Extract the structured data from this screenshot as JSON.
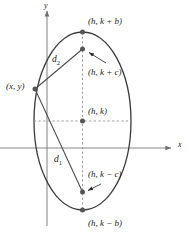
{
  "figure": {
    "type": "ellipse-definition-diagram",
    "background_color": "#ffffff",
    "curve_color": "#3a3a3a",
    "axis_color": "#8a8a8a",
    "dash_color": "#9a9a9a",
    "point_color": "#555555",
    "text_color": "#1a1a1a"
  },
  "axes": {
    "x_label": "x",
    "y_label": "y",
    "x_axis": {
      "y": 148,
      "x_start": 0,
      "x_end": 171,
      "arrow": true
    },
    "y_axis": {
      "x": 47,
      "y_start": 11,
      "y_end": 226,
      "arrow": true
    }
  },
  "ellipse": {
    "center_x": 82.5,
    "center_y": 121,
    "radius_x": 48.5,
    "radius_y": 89
  },
  "points": [
    {
      "id": "vertex-top",
      "label": "(h, k + b)",
      "x": 82.5,
      "y": 32,
      "label_x": 88,
      "label_y": 17
    },
    {
      "id": "focus-upper",
      "label": "(h, k + c)",
      "x": 82.5,
      "y": 49,
      "label_x": 88,
      "label_y": 68
    },
    {
      "id": "point-on-curve",
      "label": "(x, y)",
      "x": 35,
      "y": 89,
      "label_x": 6,
      "label_y": 82
    },
    {
      "id": "center",
      "label": "(h, k)",
      "x": 82.5,
      "y": 121,
      "label_x": 88,
      "label_y": 107
    },
    {
      "id": "focus-lower",
      "label": "(h, k − c)",
      "x": 82.5,
      "y": 192,
      "label_x": 88,
      "label_y": 170
    },
    {
      "id": "vertex-bottom",
      "label": "(h, k − b)",
      "x": 82.5,
      "y": 210,
      "label_x": 88,
      "label_y": 219
    }
  ],
  "segments": [
    {
      "id": "d2",
      "label": "d",
      "sub": "2",
      "from": "point-on-curve",
      "to": "focus-upper",
      "label_x": 52,
      "label_y": 55
    },
    {
      "id": "d1",
      "label": "d",
      "sub": "1",
      "from": "point-on-curve",
      "to": "focus-lower",
      "label_x": 54,
      "label_y": 155
    }
  ],
  "leader_arrows": [
    {
      "id": "leader-focus-upper",
      "from_x": 106,
      "from_y": 63,
      "to_x": 88,
      "to_y": 52
    },
    {
      "id": "leader-focus-lower",
      "from_x": 100,
      "from_y": 184,
      "to_x": 87,
      "to_y": 191
    }
  ],
  "guides": [
    {
      "id": "minor-axis-guide",
      "orientation": "horizontal",
      "x1": 34,
      "y1": 121,
      "x2": 131,
      "y2": 121
    },
    {
      "id": "major-axis-guide",
      "orientation": "vertical",
      "x1": 82.5,
      "y1": 32,
      "x2": 82.5,
      "y2": 210
    }
  ]
}
